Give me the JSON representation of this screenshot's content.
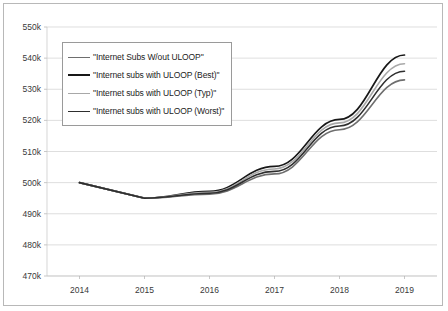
{
  "chart_data": {
    "type": "line",
    "title": "",
    "xlabel": "",
    "ylabel": "",
    "categories": [
      "2014",
      "2015",
      "2016",
      "2017",
      "2018",
      "2019"
    ],
    "x": [
      2014,
      2015,
      2016,
      2017,
      2018,
      2019
    ],
    "ylim": [
      470000,
      550000
    ],
    "ytick_labels": [
      "550k",
      "540k",
      "530k",
      "520k",
      "510k",
      "500k",
      "490k",
      "480k",
      "470k"
    ],
    "ytick_values": [
      550000,
      540000,
      530000,
      520000,
      510000,
      500000,
      490000,
      480000,
      470000
    ],
    "grid": true,
    "legend_position": "upper-left-inside",
    "series": [
      {
        "name": "\"Internet Subs W/out ULOOP\"",
        "color": "#6e6e6e",
        "width": 1.6,
        "values": [
          500000,
          495000,
          496300,
          502800,
          517000,
          533000
        ]
      },
      {
        "name": "\"Internet subs with ULOOP (Best)\"",
        "color": "#181818",
        "width": 1.7,
        "values": [
          500000,
          495000,
          497200,
          505200,
          520300,
          541000
        ]
      },
      {
        "name": "\"Internet subs with ULOOP (Typ)\"",
        "color": "#a8a8a8",
        "width": 1.6,
        "values": [
          500000,
          495000,
          496900,
          504400,
          519200,
          538200
        ]
      },
      {
        "name": "\"Internet subs with ULOOP (Worst)\"",
        "color": "#2e2e2e",
        "width": 1.6,
        "values": [
          500000,
          495000,
          496600,
          503600,
          518200,
          535800
        ]
      }
    ]
  }
}
